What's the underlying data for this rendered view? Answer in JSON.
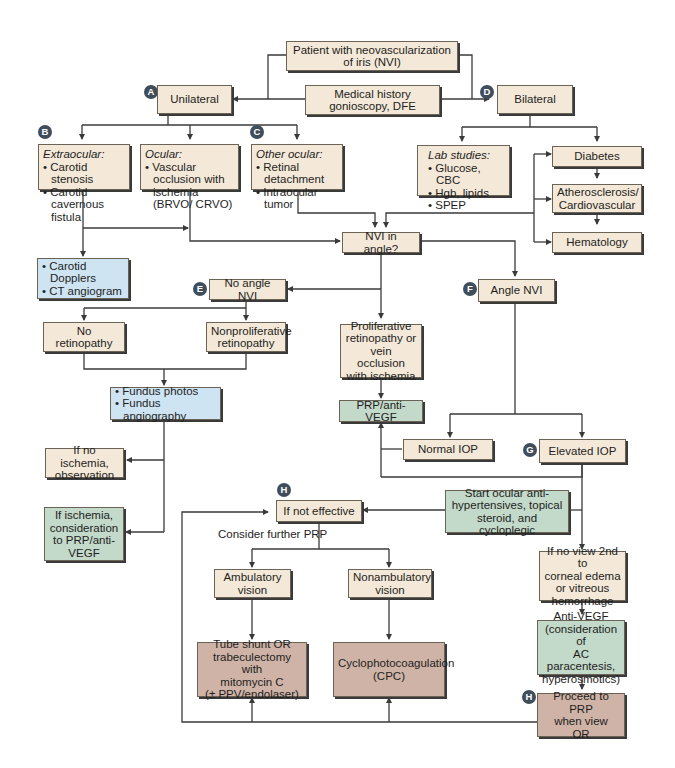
{
  "colors": {
    "tan": "#f4e9d8",
    "blue": "#cfe4f2",
    "green": "#c3d9c9",
    "brown": "#cfb3a6",
    "badge": "#3f4d5c",
    "line": "#3a3a3a"
  },
  "badges": {
    "A": "A",
    "B": "B",
    "C": "C",
    "D": "D",
    "E": "E",
    "F": "F",
    "G": "G",
    "H1": "H",
    "H2": "H"
  },
  "nodes": {
    "patient": {
      "lines": [
        "Patient with neovascularization",
        "of iris (NVI)"
      ]
    },
    "medical_history": {
      "lines": [
        "Medical history",
        "gonioscopy, DFE"
      ]
    },
    "unilateral": {
      "lines": [
        "Unilateral"
      ]
    },
    "bilateral": {
      "lines": [
        "Bilateral"
      ]
    },
    "extraocular": {
      "header": "Extraocular:",
      "bullets": [
        "Carotid stenosis",
        "Carotid cavernous fistula"
      ]
    },
    "ocular": {
      "header": "Ocular:",
      "bullets": [
        "Vascular occlusion with ischemia (BRVO/ CRVO)"
      ]
    },
    "other_ocular": {
      "header": "Other ocular:",
      "bullets": [
        "Retinal detachment",
        "Intraocular tumor"
      ]
    },
    "lab_studies": {
      "header": "Lab studies:",
      "bullets": [
        "Glucose, CBC",
        "Hgb, lipids",
        "SPEP"
      ]
    },
    "diabetes": {
      "lines": [
        "Diabetes"
      ]
    },
    "atherosclerosis": {
      "lines": [
        "Atherosclerosis/",
        "Cardiovascular"
      ]
    },
    "hematology": {
      "lines": [
        "Hematology"
      ]
    },
    "carotid_tests": {
      "bullets": [
        "Carotid Dopplers",
        "CT angiogram"
      ]
    },
    "nvi_in_angle": {
      "lines": [
        "NVI in angle?"
      ]
    },
    "no_angle_nvi": {
      "lines": [
        "No angle NVI"
      ]
    },
    "angle_nvi": {
      "lines": [
        "Angle NVI"
      ]
    },
    "no_retinopathy": {
      "lines": [
        "No retinopathy"
      ]
    },
    "nonproliferative": {
      "lines": [
        "Nonproliferative",
        "retinopathy"
      ]
    },
    "proliferative": {
      "lines": [
        "Proliferative",
        "retinopathy or",
        "vein occlusion",
        "with ischemia"
      ]
    },
    "fundus_tests": {
      "bullets": [
        "Fundus photos",
        "Fundus angiography"
      ]
    },
    "prp_anti_vegf": {
      "lines": [
        "PRP/anti-VEGF"
      ]
    },
    "normal_iop": {
      "lines": [
        "Normal IOP"
      ]
    },
    "elevated_iop": {
      "lines": [
        "Elevated IOP"
      ]
    },
    "no_ischemia": {
      "lines": [
        "If no ischemia,",
        "observation"
      ]
    },
    "if_ischemia": {
      "lines": [
        "If ischemia,",
        "consideration",
        "to PRP/anti-",
        "VEGF"
      ]
    },
    "if_not_effective": {
      "lines": [
        "If not effective"
      ]
    },
    "start_ocular": {
      "lines": [
        "Start ocular anti-",
        "hypertensives, topical",
        "steroid, and cycloplegic"
      ]
    },
    "ambulatory": {
      "lines": [
        "Ambulatory",
        "vision"
      ]
    },
    "nonambulatory": {
      "lines": [
        "Nonambulatory",
        "vision"
      ]
    },
    "no_view": {
      "lines": [
        "If no view 2nd to",
        "corneal edema",
        "or vitreous",
        "hemorrhage"
      ]
    },
    "anti_vegf": {
      "lines": [
        "Anti-VEGF",
        "(consideration of",
        "AC paracentesis,",
        "hyperosmotics)"
      ]
    },
    "tube_shunt": {
      "lines": [
        "Tube shunt OR",
        "trabeculectomy with",
        "mitomycin C",
        "(± PPV/endolaser)"
      ]
    },
    "cpc": {
      "lines": [
        "Cyclophotocoagulation",
        "(CPC)"
      ]
    },
    "proceed_prp": {
      "lines": [
        "Proceed to PRP",
        "when view",
        "OR"
      ]
    }
  },
  "annotations": {
    "consider_further_prp": "Consider further PRP"
  }
}
